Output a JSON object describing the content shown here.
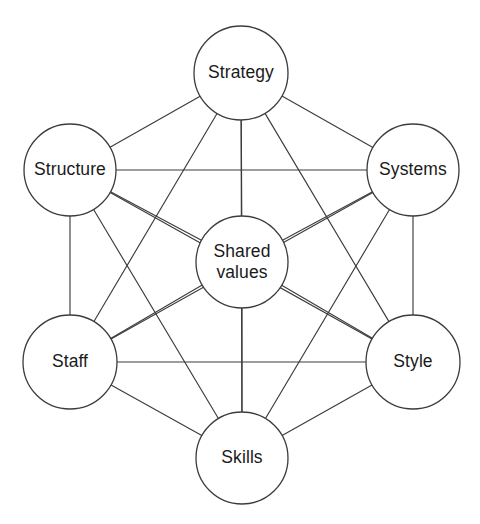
{
  "diagram": {
    "type": "network-diagram",
    "background_color": "#ffffff",
    "line_color": "#3c3c3c",
    "text_color": "#1a1a1a",
    "node_fill": "#ffffff"
  },
  "nodes": [
    {
      "id": "strategy",
      "label": "Strategy",
      "lines": [
        "Strategy"
      ],
      "cx": 241,
      "cy": 73,
      "r": 47
    },
    {
      "id": "structure",
      "label": "Structure",
      "lines": [
        "Structure"
      ],
      "cx": 70,
      "cy": 170,
      "r": 46
    },
    {
      "id": "systems",
      "label": "Systems",
      "lines": [
        "Systems"
      ],
      "cx": 413,
      "cy": 170,
      "r": 46
    },
    {
      "id": "shared-values",
      "label": "Shared values",
      "lines": [
        "Shared",
        "values"
      ],
      "cx": 242,
      "cy": 262,
      "r": 46
    },
    {
      "id": "staff",
      "label": "Staff",
      "lines": [
        "Staff"
      ],
      "cx": 70,
      "cy": 362,
      "r": 47
    },
    {
      "id": "style",
      "label": "Style",
      "lines": [
        "Style"
      ],
      "cx": 413,
      "cy": 362,
      "r": 47
    },
    {
      "id": "skills",
      "label": "Skills",
      "lines": [
        "Skills"
      ],
      "cx": 242,
      "cy": 458,
      "r": 46
    }
  ],
  "edges": [
    {
      "from": "strategy",
      "to": "structure"
    },
    {
      "from": "strategy",
      "to": "systems"
    },
    {
      "from": "strategy",
      "to": "shared-values"
    },
    {
      "from": "strategy",
      "to": "staff"
    },
    {
      "from": "strategy",
      "to": "style"
    },
    {
      "from": "strategy",
      "to": "skills"
    },
    {
      "from": "structure",
      "to": "systems"
    },
    {
      "from": "structure",
      "to": "shared-values"
    },
    {
      "from": "structure",
      "to": "staff"
    },
    {
      "from": "structure",
      "to": "style"
    },
    {
      "from": "structure",
      "to": "skills"
    },
    {
      "from": "systems",
      "to": "shared-values"
    },
    {
      "from": "systems",
      "to": "staff"
    },
    {
      "from": "systems",
      "to": "style"
    },
    {
      "from": "systems",
      "to": "skills"
    },
    {
      "from": "shared-values",
      "to": "staff"
    },
    {
      "from": "shared-values",
      "to": "style"
    },
    {
      "from": "shared-values",
      "to": "skills"
    },
    {
      "from": "staff",
      "to": "style"
    },
    {
      "from": "staff",
      "to": "skills"
    },
    {
      "from": "style",
      "to": "skills"
    }
  ]
}
